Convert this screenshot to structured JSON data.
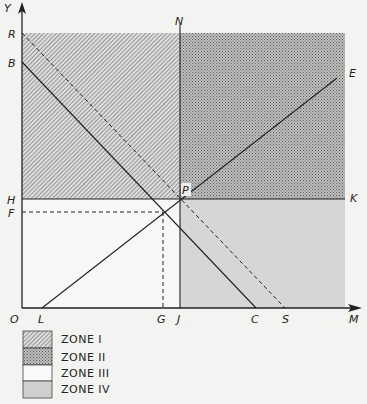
{
  "diagram": {
    "type": "zone-diagram",
    "axes": {
      "x_axis_label": "M",
      "y_axis_label": "Y",
      "origin_label": "O"
    },
    "points": {
      "R": "R",
      "B": "B",
      "H": "H",
      "F": "F",
      "N": "N",
      "E": "E",
      "P": "P",
      "K": "K",
      "L": "L",
      "G": "G",
      "J": "J",
      "C": "C",
      "S": "S"
    },
    "lines": [
      {
        "from": "B",
        "to": "C",
        "style": "solid"
      },
      {
        "from": "R",
        "to": "S",
        "style": "dashed"
      },
      {
        "from": "L",
        "to": "E",
        "style": "solid"
      },
      {
        "from": "H",
        "to": "K",
        "style": "solid"
      },
      {
        "from": "N",
        "to": "J",
        "style": "solid"
      },
      {
        "from": "F",
        "to": "intersection",
        "style": "dashed"
      },
      {
        "from": "G",
        "to": "intersection",
        "style": "dashed"
      }
    ],
    "zones": [
      {
        "id": "I",
        "region": "upper-left (above H-K, left of N-J)",
        "fill": "diagonal-hatch"
      },
      {
        "id": "II",
        "region": "upper-right (above H-K, right of N-J)",
        "fill": "dense-stipple"
      },
      {
        "id": "III",
        "region": "lower-left (below H-K, left of N-J)",
        "fill": "white"
      },
      {
        "id": "IV",
        "region": "lower-right (below H-K, right of N-J)",
        "fill": "light-gray"
      }
    ]
  },
  "legend": {
    "items": [
      {
        "label": "ZONE I",
        "fill": "hatch"
      },
      {
        "label": "ZONE II",
        "fill": "stipple"
      },
      {
        "label": "ZONE III",
        "fill": "white"
      },
      {
        "label": "ZONE IV",
        "fill": "gray"
      }
    ]
  },
  "colors": {
    "background": "#f3f3f1",
    "ink": "#222222",
    "zone_iv": "#d6d6d4",
    "zone_ii": "#a9a9a7"
  }
}
